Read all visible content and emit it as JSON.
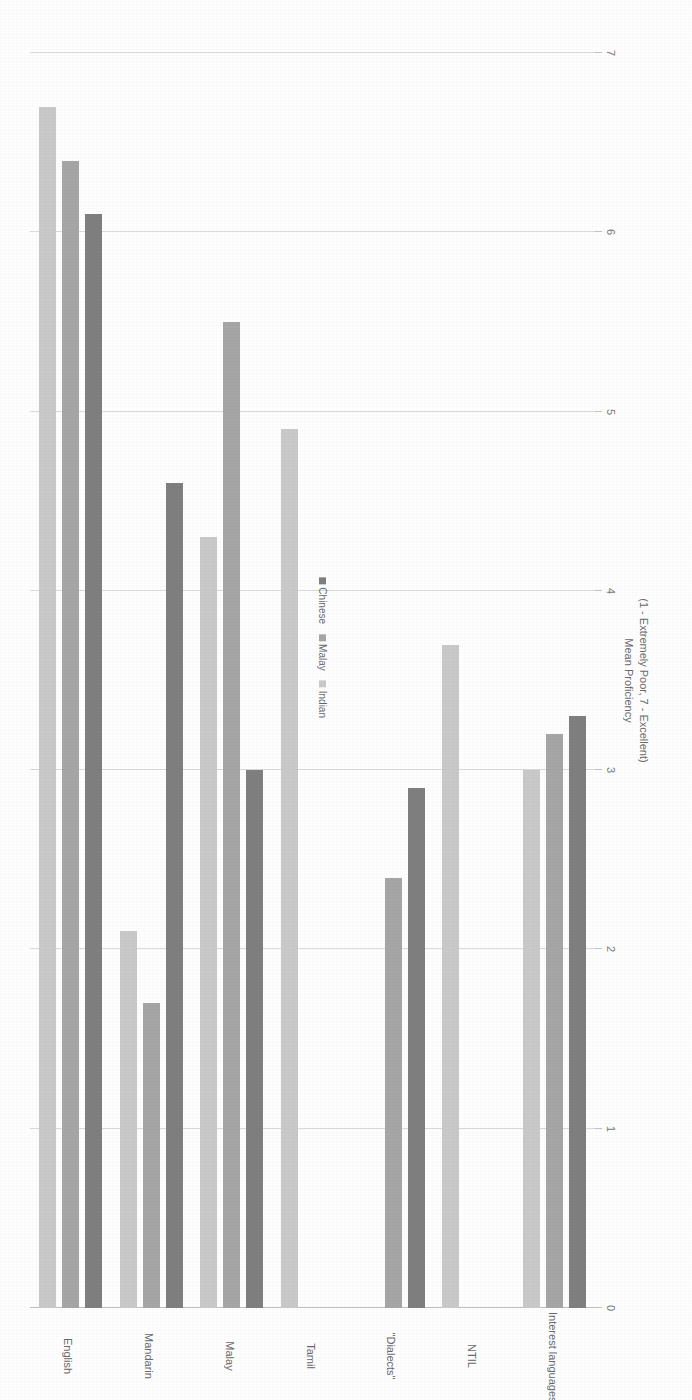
{
  "chart_data": {
    "type": "bar",
    "orientation": "horizontal",
    "title": "",
    "xlabel": "",
    "ylabel": "Mean Proficiency\n(1 - Extremely Poor, 7 - Excellent)",
    "axis_title_line1": "Mean Proficiency",
    "axis_title_line2": "(1 - Extremely Poor, 7 - Excellent)",
    "categories": [
      "English",
      "Mandarin",
      "Malay",
      "Tamil",
      "\"Dialects\"",
      "NTIL",
      "Interest languages"
    ],
    "series": [
      {
        "name": "Chinese",
        "color": "#7f7f7f",
        "values": [
          6.1,
          4.6,
          3.0,
          null,
          2.9,
          null,
          3.3
        ]
      },
      {
        "name": "Malay",
        "color": "#a6a6a6",
        "values": [
          6.4,
          1.7,
          5.5,
          null,
          2.4,
          null,
          3.2
        ]
      },
      {
        "name": "Indian",
        "color": "#c9c9c9",
        "values": [
          6.7,
          2.1,
          4.3,
          4.9,
          null,
          3.7,
          3.0
        ]
      }
    ],
    "xlim": [
      0,
      7
    ],
    "ticks": [
      "0",
      "1",
      "2",
      "3",
      "4",
      "5",
      "6",
      "7"
    ],
    "grid": true,
    "legend_position": "bottom-center",
    "legend_entries": [
      "Chinese",
      "Malay",
      "Indian"
    ]
  }
}
